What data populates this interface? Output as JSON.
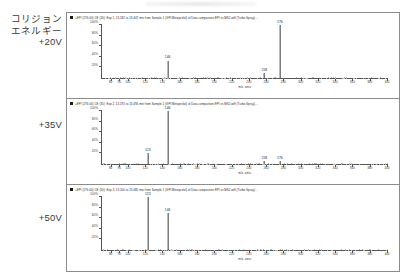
{
  "page": {
    "background_color": "#ffffff",
    "axis_color": "#555555",
    "trace_color": "#3a3a3a",
    "panel_border_color": "#8c8c8c"
  },
  "legend_column": {
    "heading_lines": [
      "コリジョン",
      "エネルギー"
    ],
    "entries": [
      {
        "id": "ce-20",
        "lines": [
          "コリジョン",
          "エネルギー",
          "+20V"
        ],
        "value": "+20V"
      },
      {
        "id": "ce-35",
        "lines": [
          "+35V"
        ],
        "value": "+35V"
      },
      {
        "id": "ce-50",
        "lines": [
          "+50V"
        ],
        "value": "+50V"
      }
    ]
  },
  "panels": [
    {
      "id": "panel-20v",
      "title": "+EPI (276.00) CE (20): Exp 1, 13.182 to 13.447 min from Sample 1 (GPI Metoprolol) of Data comparison EPI vs MS2.wiff (Turbo Spray)...",
      "collision_energy": "+20V"
    },
    {
      "id": "panel-35v",
      "title": "+EPI (276.00) CE (35): Exp 2, 13.191 to 13.494 min from Sample 1 (GPI Metoprolol) of Data comparison EPI vs MS2.wiff (Turbo Spray)...",
      "collision_energy": "+35V"
    },
    {
      "id": "panel-50v",
      "title": "+EPI (276.00) CE (50): Exp 3, 13.200 to 13.485 min from Sample 1 (GPI Metoprolol) of Data comparison EPI vs MS2.wiff (Turbo Spray)...",
      "collision_energy": "+50V"
    }
  ],
  "chart_data": [
    {
      "type": "bar",
      "id": "ms-spectrum-20v",
      "title": "+EPI (276.00) CE (20): Exp 1, 13.182 to 13.447 min from Sample 1 (GPI Metoprolol) of Data comparison EPI vs MS2.wiff (Turbo Spray)...",
      "xlabel": "m/z, amu",
      "ylabel": "",
      "xlim": [
        70,
        400
      ],
      "ylim": [
        0,
        100
      ],
      "grid": false,
      "legend": "none",
      "xticks": [
        80,
        90,
        100,
        120,
        140,
        160,
        180,
        200,
        220,
        240,
        260,
        280,
        300,
        320,
        340,
        360,
        380,
        400
      ],
      "xticklabels": [
        "80",
        "90",
        "100",
        "120",
        "140",
        "160",
        "180",
        "200",
        "220",
        "240",
        "260",
        "280",
        "300",
        "320",
        "340",
        "360",
        "380",
        "400"
      ],
      "yticks": [
        20,
        40,
        60,
        80,
        100
      ],
      "yticklabels": [
        "20%",
        "40%",
        "60%",
        "80%",
        "100%"
      ],
      "x": [
        276,
        258,
        146
      ],
      "values": [
        100,
        9,
        33
      ],
      "annotations": [
        {
          "label": "276",
          "x": 276,
          "y": 100
        },
        {
          "label": "258",
          "x": 258,
          "y": 9
        },
        {
          "label": "146",
          "x": 146,
          "y": 33
        }
      ]
    },
    {
      "type": "bar",
      "id": "ms-spectrum-35v",
      "title": "+EPI (276.00) CE (35): Exp 2, 13.191 to 13.494 min from Sample 1 (GPI Metoprolol) of Data comparison EPI vs MS2.wiff (Turbo Spray)...",
      "xlabel": "m/z, amu",
      "ylabel": "",
      "xlim": [
        70,
        400
      ],
      "ylim": [
        0,
        100
      ],
      "grid": false,
      "legend": "none",
      "xticks": [
        80,
        90,
        100,
        120,
        140,
        160,
        180,
        200,
        220,
        240,
        260,
        280,
        300,
        320,
        340,
        360,
        380,
        400
      ],
      "xticklabels": [
        "80",
        "90",
        "100",
        "120",
        "140",
        "160",
        "180",
        "200",
        "220",
        "240",
        "260",
        "280",
        "300",
        "320",
        "340",
        "360",
        "380",
        "400"
      ],
      "yticks": [
        20,
        40,
        60,
        80,
        100
      ],
      "yticklabels": [
        "20%",
        "40%",
        "60%",
        "80%",
        "100%"
      ],
      "x": [
        123,
        146,
        258,
        276
      ],
      "values": [
        20,
        100,
        5,
        5
      ],
      "annotations": [
        {
          "label": "123",
          "x": 123,
          "y": 20
        },
        {
          "label": "146",
          "x": 146,
          "y": 100
        },
        {
          "label": "258",
          "x": 258,
          "y": 5
        },
        {
          "label": "276",
          "x": 276,
          "y": 5
        }
      ]
    },
    {
      "type": "bar",
      "id": "ms-spectrum-50v",
      "title": "+EPI (276.00) CE (50): Exp 3, 13.200 to 13.485 min from Sample 1 (GPI Metoprolol) of Data comparison EPI vs MS2.wiff (Turbo Spray)...",
      "xlabel": "m/z, amu",
      "ylabel": "",
      "xlim": [
        70,
        400
      ],
      "ylim": [
        0,
        100
      ],
      "grid": false,
      "legend": "none",
      "xticks": [
        80,
        90,
        100,
        120,
        140,
        160,
        180,
        200,
        220,
        240,
        260,
        280,
        300,
        320,
        340,
        360,
        380,
        400
      ],
      "xticklabels": [
        "80",
        "90",
        "100",
        "120",
        "140",
        "160",
        "180",
        "200",
        "220",
        "240",
        "260",
        "280",
        "300",
        "320",
        "340",
        "360",
        "380",
        "400"
      ],
      "yticks": [
        20,
        40,
        60,
        80,
        100
      ],
      "yticklabels": [
        "20%",
        "40%",
        "60%",
        "80%",
        "100%"
      ],
      "x": [
        123,
        146
      ],
      "values": [
        100,
        70
      ],
      "annotations": [
        {
          "label": "123",
          "x": 123,
          "y": 100
        },
        {
          "label": "146",
          "x": 146,
          "y": 70
        }
      ]
    }
  ]
}
